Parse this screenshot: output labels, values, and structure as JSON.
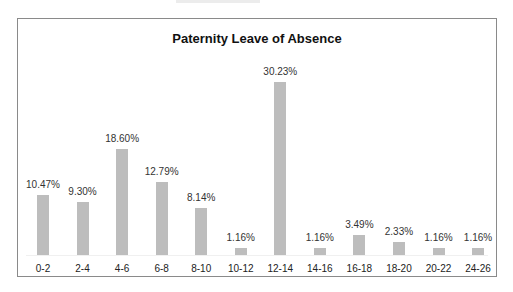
{
  "chart_data": {
    "type": "bar",
    "title": "Paternity Leave of Absence",
    "xlabel": "",
    "ylabel": "",
    "categories": [
      "0-2",
      "2-4",
      "4-6",
      "6-8",
      "8-10",
      "10-12",
      "12-14",
      "14-16",
      "16-18",
      "18-20",
      "20-22",
      "24-26"
    ],
    "values": [
      10.47,
      9.3,
      18.6,
      12.79,
      8.14,
      1.16,
      30.23,
      1.16,
      3.49,
      2.33,
      1.16,
      1.16
    ],
    "value_labels": [
      "10.47%",
      "9.30%",
      "18.60%",
      "12.79%",
      "8.14%",
      "1.16%",
      "30.23%",
      "1.16%",
      "3.49%",
      "2.33%",
      "1.16%",
      "1.16%"
    ],
    "ylim": [
      0,
      30.23
    ],
    "grid": false,
    "legend": "none",
    "bar_color": "#bdbdbd"
  }
}
